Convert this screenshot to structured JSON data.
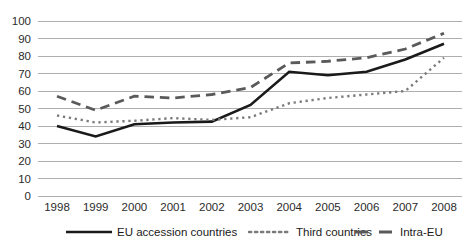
{
  "chart_data": {
    "type": "line",
    "title": "",
    "xlabel": "",
    "ylabel": "",
    "categories": [
      "1998",
      "1999",
      "2000",
      "2001",
      "2002",
      "2003",
      "2004",
      "2005",
      "2006",
      "2007",
      "2008"
    ],
    "ylim": [
      0,
      100
    ],
    "yticks": [
      0,
      10,
      20,
      30,
      40,
      50,
      60,
      70,
      80,
      90,
      100
    ],
    "grid": "horizontal",
    "legend_position": "bottom",
    "series": [
      {
        "name": "EU accession countries",
        "style": "solid",
        "color": "#1a1a1a",
        "width": 2.6,
        "values": [
          40,
          34,
          41,
          42,
          42.5,
          52,
          71,
          69,
          71,
          78,
          87
        ]
      },
      {
        "name": "Third countries",
        "style": "dotted",
        "color": "#7a7a7a",
        "width": 2.4,
        "values": [
          46,
          42,
          43,
          44.5,
          43.5,
          45,
          53,
          56,
          58,
          60,
          79
        ]
      },
      {
        "name": "Intra-EU",
        "style": "dashed",
        "color": "#5a5a5a",
        "width": 2.8,
        "values": [
          57,
          49,
          57,
          56,
          58,
          62,
          76,
          77,
          79,
          84,
          93
        ]
      }
    ]
  },
  "axes": {
    "y_tick_labels": [
      "100",
      "90",
      "80",
      "70",
      "60",
      "50",
      "40",
      "30",
      "20",
      "10",
      "0"
    ],
    "x_tick_labels": [
      "1998",
      "1999",
      "2000",
      "2001",
      "2002",
      "2003",
      "2004",
      "2005",
      "2006",
      "2007",
      "2008"
    ]
  },
  "legend": {
    "items": [
      {
        "label": "EU accession countries",
        "swatch": "solid-line-swatch"
      },
      {
        "label": "Third countries",
        "swatch": "dotted-line-swatch"
      },
      {
        "label": "Intra-EU",
        "swatch": "dashed-line-swatch"
      }
    ]
  },
  "colors": {
    "grid": "#a6a6a6",
    "accession": "#1a1a1a",
    "third": "#7a7a7a",
    "intra": "#5a5a5a",
    "background": "#ffffff",
    "text": "#1a1a1a"
  }
}
